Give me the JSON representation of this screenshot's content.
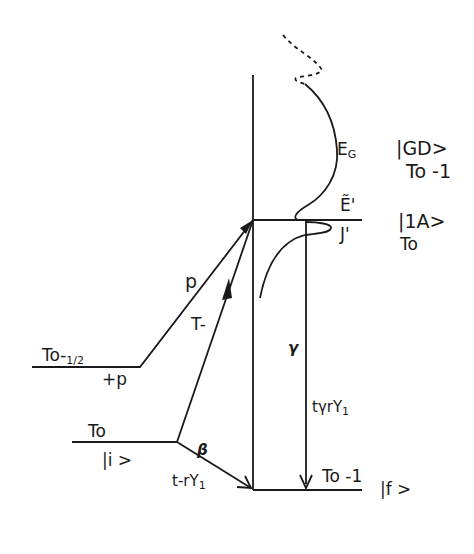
{
  "diagram": {
    "type": "energy-level-transition-diagram",
    "levels": {
      "initial": {
        "energy_label": "To",
        "state_label": "|i >"
      },
      "half": {
        "energy_label": "To-",
        "fraction": "1/2",
        "extra_label": "+p"
      },
      "intermediate": {
        "energy_label_top": "Ẽ'",
        "energy_label_bottom": "J'",
        "state_label": "|1A>",
        "sub_label": "To"
      },
      "giant_dipole": {
        "energy_label": "E",
        "energy_sub": "G",
        "state_label": "|GD>",
        "sub_label": "To -1"
      },
      "final": {
        "energy_label": "To -1",
        "state_label": "|f >"
      }
    },
    "transitions": {
      "p": "p",
      "t_minus": "T-",
      "beta": "β",
      "t_r_y": {
        "main": "t-rY",
        "sub": "1"
      },
      "gamma": "γ",
      "t_gamma_r_y": {
        "main": "tγrY",
        "sub": "1"
      }
    }
  }
}
